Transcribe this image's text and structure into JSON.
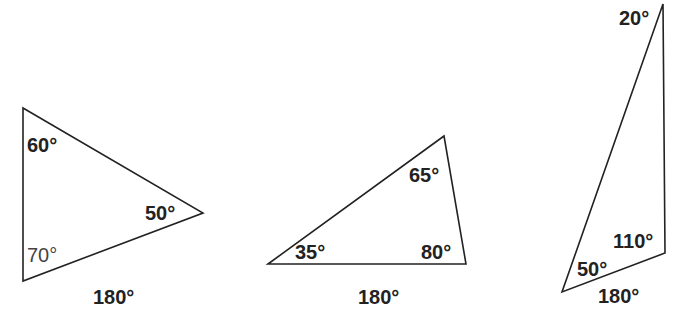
{
  "diagram": {
    "triangles": [
      {
        "id": "triangle-1",
        "vertices": [
          [
            23,
            108
          ],
          [
            203,
            213
          ],
          [
            23,
            281
          ]
        ],
        "angles": [
          {
            "label": "60°",
            "x": 27,
            "y": 152,
            "weight": "bold"
          },
          {
            "label": "50°",
            "x": 145,
            "y": 220,
            "weight": "bold"
          },
          {
            "label": "70°",
            "x": 27,
            "y": 262,
            "weight": "normal"
          }
        ],
        "sum_label": {
          "label": "180°",
          "x": 93,
          "y": 304
        }
      },
      {
        "id": "triangle-2",
        "vertices": [
          [
            268,
            264
          ],
          [
            444,
            136
          ],
          [
            466,
            264
          ]
        ],
        "angles": [
          {
            "label": "65°",
            "x": 409,
            "y": 182,
            "weight": "bold"
          },
          {
            "label": "35°",
            "x": 295,
            "y": 259,
            "weight": "bold"
          },
          {
            "label": "80°",
            "x": 421,
            "y": 259,
            "weight": "bold"
          }
        ],
        "sum_label": {
          "label": "180°",
          "x": 358,
          "y": 304
        }
      },
      {
        "id": "triangle-3",
        "vertices": [
          [
            663,
            4
          ],
          [
            665,
            253
          ],
          [
            562,
            292
          ]
        ],
        "angles": [
          {
            "label": "20°",
            "x": 619,
            "y": 25,
            "weight": "bold"
          },
          {
            "label": "110°",
            "x": 613,
            "y": 248,
            "weight": "bold"
          },
          {
            "label": "50°",
            "x": 577,
            "y": 276,
            "weight": "bold"
          }
        ],
        "sum_label": {
          "label": "180°",
          "x": 598,
          "y": 303
        }
      }
    ]
  },
  "colors": {
    "stroke": "#222222",
    "text": "#222222",
    "text_light": "#444444",
    "background": "#ffffff"
  }
}
